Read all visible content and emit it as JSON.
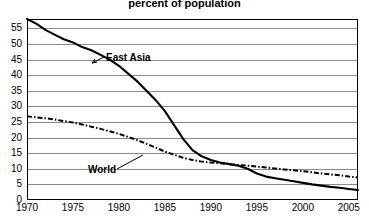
{
  "title": {
    "line1": "Share of the population living on less than $1 a day,",
    "line2": "percent of population"
  },
  "annotations": {
    "east_asia": "East Asia",
    "world": "World"
  },
  "axis": {
    "y_ticks": [
      "0",
      "5",
      "10",
      "15",
      "20",
      "25",
      "30",
      "35",
      "40",
      "45",
      "50",
      "55"
    ],
    "x_ticks": [
      "1970",
      "1975",
      "1980",
      "1985",
      "1990",
      "1995",
      "2000",
      "2005"
    ]
  },
  "colors": {
    "line": "#000000",
    "grid": "#8a8a8a",
    "frame": "#000000",
    "background": "#ffffff"
  },
  "chart_data": {
    "type": "line",
    "title": "Share of the population living on less than $1 a day, percent of population",
    "xlabel": "",
    "ylabel": "percent of population",
    "xlim": [
      1970,
      2006
    ],
    "ylim": [
      0,
      58
    ],
    "grid": true,
    "legend": "inline-annotations",
    "x_ticks": [
      1970,
      1975,
      1980,
      1985,
      1990,
      1995,
      2000,
      2005
    ],
    "y_ticks": [
      0,
      5,
      10,
      15,
      20,
      25,
      30,
      35,
      40,
      45,
      50,
      55
    ],
    "series": [
      {
        "name": "East Asia",
        "style": "solid",
        "x": [
          1970,
          1971,
          1972,
          1973,
          1974,
          1975,
          1976,
          1977,
          1978,
          1979,
          1980,
          1981,
          1982,
          1983,
          1984,
          1985,
          1986,
          1987,
          1988,
          1989,
          1990,
          1991,
          1992,
          1993,
          1994,
          1995,
          1996,
          1997,
          1998,
          1999,
          2000,
          2001,
          2002,
          2003,
          2004,
          2005,
          2006
        ],
        "values": [
          58.0,
          56.5,
          54.5,
          53.0,
          51.5,
          50.5,
          49.0,
          48.0,
          46.5,
          45.0,
          43.0,
          40.5,
          38.0,
          35.0,
          32.0,
          28.5,
          24.0,
          19.5,
          16.0,
          14.0,
          12.8,
          12.0,
          11.5,
          11.0,
          10.0,
          8.5,
          7.5,
          7.0,
          6.5,
          6.0,
          5.5,
          5.0,
          4.6,
          4.2,
          3.9,
          3.5,
          3.2
        ]
      },
      {
        "name": "World",
        "style": "dash-dot",
        "x": [
          1970,
          1971,
          1972,
          1973,
          1974,
          1975,
          1976,
          1977,
          1978,
          1979,
          1980,
          1981,
          1982,
          1983,
          1984,
          1985,
          1986,
          1987,
          1988,
          1989,
          1990,
          1991,
          1992,
          1993,
          1994,
          1995,
          1996,
          1997,
          1998,
          1999,
          2000,
          2001,
          2002,
          2003,
          2004,
          2005,
          2006
        ],
        "values": [
          26.8,
          26.5,
          26.2,
          25.8,
          25.3,
          24.8,
          24.2,
          23.5,
          22.8,
          22.0,
          21.2,
          20.2,
          19.2,
          18.0,
          16.8,
          15.5,
          14.5,
          13.5,
          12.8,
          12.3,
          12.0,
          11.8,
          11.5,
          11.2,
          11.0,
          10.7,
          10.4,
          10.1,
          9.8,
          9.5,
          9.2,
          8.9,
          8.5,
          8.2,
          7.9,
          7.5,
          7.2
        ]
      }
    ]
  }
}
